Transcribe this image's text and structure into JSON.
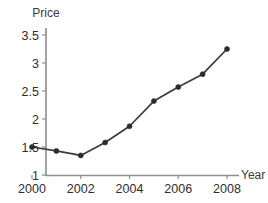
{
  "chart_data": {
    "type": "line",
    "title": "",
    "xlabel": "Year",
    "ylabel": "Price",
    "x": [
      2000,
      2001,
      2002,
      2003,
      2004,
      2005,
      2006,
      2007,
      2008
    ],
    "values": [
      1.5,
      1.43,
      1.35,
      1.58,
      1.87,
      2.32,
      2.57,
      2.8,
      3.25
    ],
    "series": [
      {
        "name": "Price",
        "values": [
          1.5,
          1.43,
          1.35,
          1.58,
          1.87,
          2.32,
          2.57,
          2.8,
          3.25
        ]
      }
    ],
    "xlim": [
      2000,
      2008.6
    ],
    "ylim": [
      1,
      3.6
    ],
    "x_tick_labels": [
      "2000",
      "2002",
      "2004",
      "2006",
      "2008"
    ],
    "x_tick_values": [
      2000,
      2002,
      2004,
      2006,
      2008
    ],
    "y_tick_labels": [
      "1",
      "1.5",
      "2",
      "2.5",
      "3",
      "3.5"
    ],
    "y_tick_values": [
      1,
      1.5,
      2,
      2.5,
      3,
      3.5
    ],
    "grid": false,
    "legend": "none",
    "marker": "circle",
    "line_color": "#3b3b3b",
    "marker_color": "#2b2b2b",
    "axis_color": "#8d8d8d",
    "background_color": "#ffffff"
  },
  "labels": {
    "y_axis_title": "Price",
    "x_axis_title": "Year"
  }
}
